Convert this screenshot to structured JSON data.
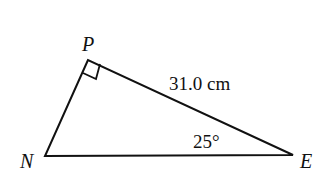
{
  "diagram": {
    "type": "right-triangle",
    "vertices": {
      "P": {
        "label": "P",
        "x": 88,
        "y": 60
      },
      "N": {
        "label": "N",
        "x": 45,
        "y": 156
      },
      "E": {
        "label": "E",
        "x": 293,
        "y": 155
      }
    },
    "right_angle_at": "P",
    "side_label": "31.0 cm",
    "angle_label": "25°",
    "colors": {
      "stroke": "#111111",
      "background": "#ffffff"
    }
  }
}
